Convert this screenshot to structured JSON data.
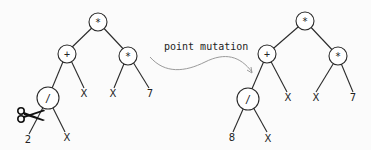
{
  "figure": {
    "type": "genetic-programming-point-mutation",
    "caption": "point mutation",
    "colors": {
      "stroke": "#2a2a2a",
      "node_fill": "#ffffff",
      "arrow": "#9a9a9a",
      "background": "#fbfbfb"
    }
  },
  "left_tree": {
    "nodes": {
      "root": "*",
      "plus": "+",
      "times": "*",
      "div": "/",
      "x1": "X",
      "x2": "X",
      "seven": "7",
      "leaf_cut": "2",
      "x3": "X"
    },
    "scissors_icon": "scissors-icon"
  },
  "right_tree": {
    "nodes": {
      "root": "*",
      "plus": "+",
      "times": "*",
      "div": "/",
      "x1": "X",
      "x2": "X",
      "seven": "7",
      "leaf_new": "8",
      "x3": "X"
    }
  }
}
